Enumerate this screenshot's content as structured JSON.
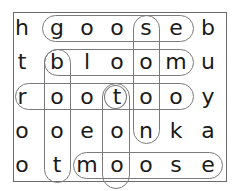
{
  "puzzle": {
    "type": "word-search",
    "rows": 5,
    "cols": 7,
    "grid": [
      [
        "h",
        "g",
        "o",
        "o",
        "s",
        "e",
        "b"
      ],
      [
        "t",
        "b",
        "l",
        "o",
        "o",
        "m",
        "u"
      ],
      [
        "r",
        "o",
        "o",
        "t",
        "o",
        "o",
        "y"
      ],
      [
        "o",
        "o",
        "e",
        "o",
        "n",
        "k",
        "a"
      ],
      [
        "o",
        "t",
        "m",
        "o",
        "o",
        "s",
        "e"
      ]
    ],
    "found_words": [
      {
        "word": "goose",
        "direction": "horizontal",
        "row": 0,
        "col_start": 1,
        "col_end": 5
      },
      {
        "word": "bloom",
        "direction": "horizontal",
        "row": 1,
        "col_start": 1,
        "col_end": 5
      },
      {
        "word": "rootoo",
        "direction": "horizontal",
        "row": 2,
        "col_start": 0,
        "col_end": 5
      },
      {
        "word": "moose",
        "direction": "horizontal",
        "row": 4,
        "col_start": 2,
        "col_end": 6
      },
      {
        "word": "boot",
        "direction": "vertical",
        "col": 1,
        "row_start": 1,
        "row_end": 4
      },
      {
        "word": "soon",
        "direction": "vertical",
        "col": 4,
        "row_start": 0,
        "row_end": 3
      },
      {
        "word": "too",
        "direction": "vertical",
        "col": 3,
        "row_start": 2,
        "row_end": 4
      },
      {
        "word": "t",
        "direction": "single",
        "row": 2,
        "col": 3
      }
    ],
    "colors": {
      "border": "#6b6b6b",
      "oval": "#7a7a7a",
      "text": "#1a1a1a"
    }
  }
}
